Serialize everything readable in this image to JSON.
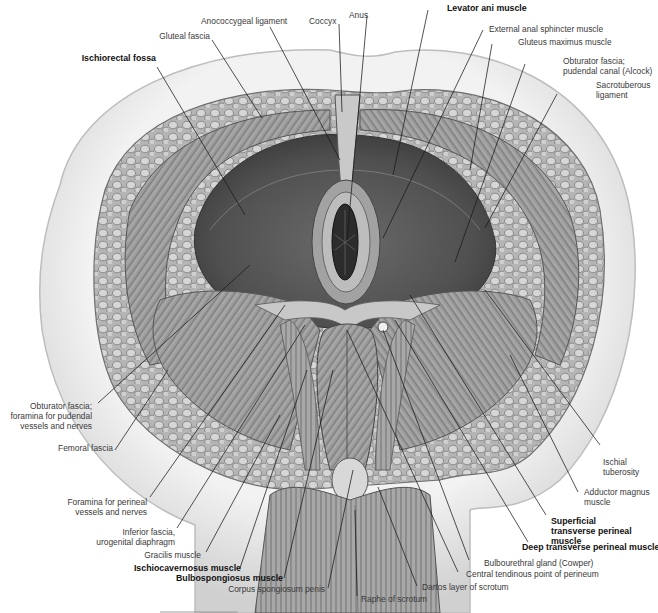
{
  "figure": {
    "colors": {
      "background": "#ffffff",
      "skin": "#dcdcdc",
      "fat": "#9a9a9a",
      "muscle": "#8c8c8c",
      "muscle_dark": "#4a4a4a",
      "leader_line": "#1a1a1a",
      "label_text": "#3a3a3a",
      "bold_label_text": "#111111"
    }
  },
  "labels": {
    "ischiorectal_fossa": {
      "lines": [
        "Ischiorectal fossa"
      ],
      "bold": true
    },
    "gluteal_fascia": {
      "lines": [
        "Gluteal fascia"
      ],
      "bold": false
    },
    "anococcygeal_ligament": {
      "lines": [
        "Anococcygeal ligament"
      ],
      "bold": false
    },
    "coccyx": {
      "lines": [
        "Coccyx"
      ],
      "bold": false
    },
    "anus": {
      "lines": [
        "Anus"
      ],
      "bold": false
    },
    "levator_ani": {
      "lines": [
        "Levator ani muscle"
      ],
      "bold": true
    },
    "external_anal_sphincter": {
      "lines": [
        "External anal sphincter muscle"
      ],
      "bold": false
    },
    "gluteus_maximus": {
      "lines": [
        "Gluteus maximus muscle"
      ],
      "bold": false
    },
    "obturator_fascia_alcock": {
      "lines": [
        "Obturator fascia;",
        "pudendal canal (Alcock)"
      ],
      "bold": false
    },
    "sacrotuberous_ligament": {
      "lines": [
        "Sacrotuberous",
        "ligament"
      ],
      "bold": false
    },
    "obturator_fascia_foramina": {
      "lines": [
        "Obturator fascia;",
        "foramina for pudendal",
        "vessels and nerves"
      ],
      "bold": false
    },
    "femoral_fascia": {
      "lines": [
        "Femoral fascia"
      ],
      "bold": false
    },
    "ischial_tuberosity": {
      "lines": [
        "Ischial",
        "tuberosity"
      ],
      "bold": false
    },
    "adductor_magnus": {
      "lines": [
        "Adductor magnus",
        "muscle"
      ],
      "bold": false
    },
    "foramina_perineal": {
      "lines": [
        "Foramina for perineal",
        "vessels and nerves"
      ],
      "bold": false
    },
    "inferior_fascia_ugd": {
      "lines": [
        "Inferior fascia,",
        "urogenital diaphragm"
      ],
      "bold": false
    },
    "superficial_transverse_perineal": {
      "lines": [
        "Superficial",
        "transverse perineal",
        "muscle"
      ],
      "bold": true
    },
    "deep_transverse_perineal": {
      "lines": [
        "Deep transverse perineal muscle"
      ],
      "bold": true
    },
    "gracilis": {
      "lines": [
        "Gracilis muscle"
      ],
      "bold": false
    },
    "bulbourethral_gland": {
      "lines": [
        "Bulbourethral gland (Cowper)"
      ],
      "bold": false
    },
    "central_tendinous_point": {
      "lines": [
        "Central tendinous point of perineum"
      ],
      "bold": false
    },
    "ischiocavernosus": {
      "lines": [
        "Ischiocavernosus muscle"
      ],
      "bold": true
    },
    "bulbospongiosus": {
      "lines": [
        "Bulbospongiosus muscle"
      ],
      "bold": true
    },
    "dartos": {
      "lines": [
        "Dartos layer of scrotum"
      ],
      "bold": false
    },
    "corpus_spongiosum": {
      "lines": [
        "Corpus spongiosum penis"
      ],
      "bold": false
    },
    "raphe_scrotum": {
      "lines": [
        "Raphe of scrotum"
      ],
      "bold": false
    }
  }
}
